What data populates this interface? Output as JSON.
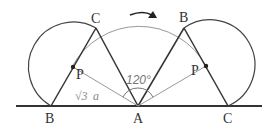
{
  "diagram": {
    "labels": {
      "left_B": "B",
      "left_C": "C",
      "left_P": "P",
      "A": "A",
      "right_B": "B",
      "right_C": "C",
      "right_P": "P",
      "angle": "120°",
      "length_sqrt": "√3",
      "length_var": "a"
    },
    "rotation_angle_degrees": 120,
    "rotation_direction": "clockwise",
    "colors": {
      "thick_line": "#333333",
      "thin_line": "#888888",
      "label": "#333333"
    }
  }
}
